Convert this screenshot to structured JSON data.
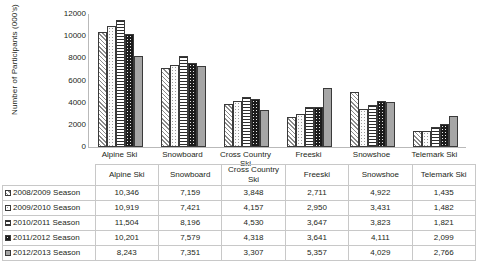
{
  "chart_data": {
    "type": "bar",
    "title": "",
    "xlabel": "",
    "ylabel": "Number of Participants (000's)",
    "ylim": [
      0,
      12000
    ],
    "yticks": [
      "0",
      "2000",
      "4000",
      "6000",
      "8000",
      "10000",
      "12000"
    ],
    "grid": false,
    "legend_position": "table-row-headers",
    "categories": [
      "Alpine Ski",
      "Snowboard",
      "Cross Country Ski",
      "Freeski",
      "Snowshoe",
      "Telemark Ski"
    ],
    "series": [
      {
        "name": "2008/2009 Season",
        "pattern": "diagonal-hatch",
        "values": [
          10346,
          7159,
          3848,
          2711,
          4922,
          1435
        ]
      },
      {
        "name": "2009/2010 Season",
        "pattern": "light-dots",
        "values": [
          10919,
          7421,
          4157,
          2950,
          3431,
          1482
        ]
      },
      {
        "name": "2010/2011 Season",
        "pattern": "horizontal-lines",
        "values": [
          11504,
          8196,
          4530,
          3647,
          3823,
          1821
        ]
      },
      {
        "name": "2011/2012 Season",
        "pattern": "dark-dots",
        "values": [
          10201,
          7579,
          4318,
          3641,
          4111,
          2099
        ]
      },
      {
        "name": "2012/2013 Season",
        "pattern": "solid-gray",
        "values": [
          8243,
          7351,
          3307,
          5357,
          4029,
          2766
        ]
      }
    ]
  },
  "table": {
    "corner": "",
    "columns": [
      "Alpine Ski",
      "Snowboard",
      "Cross Country Ski",
      "Freeski",
      "Snowshoe",
      "Telemark Ski"
    ],
    "rows": [
      {
        "label": "2008/2009 Season",
        "cells": [
          "10,346",
          "7,159",
          "3,848",
          "2,711",
          "4,922",
          "1,435"
        ]
      },
      {
        "label": "2009/2010 Season",
        "cells": [
          "10,919",
          "7,421",
          "4,157",
          "2,950",
          "3,431",
          "1,482"
        ]
      },
      {
        "label": "2010/2011 Season",
        "cells": [
          "11,504",
          "8,196",
          "4,530",
          "3,647",
          "3,823",
          "1,821"
        ]
      },
      {
        "label": "2011/2012 Season",
        "cells": [
          "10,201",
          "7,579",
          "4,318",
          "3,641",
          "4,111",
          "2,099"
        ]
      },
      {
        "label": "2012/2013 Season",
        "cells": [
          "8,243",
          "7,351",
          "3,307",
          "5,357",
          "4,029",
          "2,766"
        ]
      }
    ]
  }
}
